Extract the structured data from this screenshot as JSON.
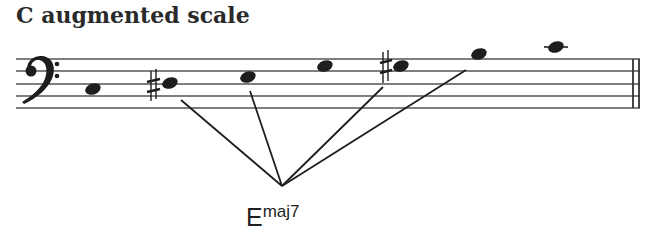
{
  "title": "C augmented scale",
  "staff": {
    "clef": "bass-clef",
    "line_count": 5,
    "final_barline": "double-barline"
  },
  "notes": [
    {
      "name": "C",
      "accidental": "",
      "ledger": false
    },
    {
      "name": "B#",
      "accidental": "sharp",
      "ledger": false
    },
    {
      "name": "E",
      "accidental": "",
      "ledger": false
    },
    {
      "name": "G",
      "accidental": "",
      "ledger": false
    },
    {
      "name": "G#",
      "accidental": "sharp",
      "ledger": false
    },
    {
      "name": "B",
      "accidental": "",
      "ledger": false
    },
    {
      "name": "C",
      "accidental": "",
      "ledger": true
    }
  ],
  "chord_annotation": {
    "root": "E",
    "quality": "maj7",
    "connected_notes": [
      "B#",
      "E",
      "G#",
      "B"
    ]
  },
  "colors": {
    "ink": "#1e1e1e",
    "staff_line": "#555555",
    "background": "#ffffff"
  }
}
